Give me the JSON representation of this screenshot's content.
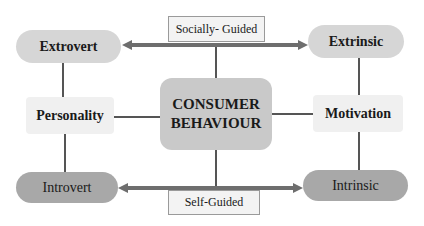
{
  "diagram": {
    "center": {
      "line1": "CONSUMER",
      "line2": "BEHAVIOUR"
    },
    "left_dimension": "Personality",
    "right_dimension": "Motivation",
    "top_left": "Extrovert",
    "top_right": "Extrinsic",
    "bottom_left": "Introvert",
    "bottom_right": "Intrinsic",
    "top_axis_label": "Socially- Guided",
    "bottom_axis_label": "Self-Guided"
  },
  "colors": {
    "arrow": "#6e6e6e",
    "pill_light": "#d6d6d6",
    "pill_dark": "#a8a8a8",
    "center_fill": "#c9c9c9",
    "line": "#555555"
  }
}
